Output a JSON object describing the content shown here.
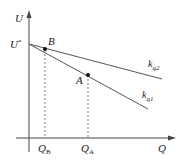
{
  "diagram": {
    "axes": {
      "y_label": "U",
      "x_label": "Q"
    },
    "origin_value": {
      "label": "U",
      "superscript": "*"
    },
    "lines": [
      {
        "name": "kq2",
        "label_main": "k",
        "label_sub": "q2",
        "role": "upper line (shallower slope)"
      },
      {
        "name": "kq1",
        "label_main": "k",
        "label_sub": "q1",
        "role": "lower line (steeper slope)"
      }
    ],
    "points": [
      {
        "name": "B",
        "label": "B",
        "line": "kq1"
      },
      {
        "name": "A",
        "label": "A",
        "line": "kq1"
      }
    ],
    "x_ticks": [
      {
        "label_main": "Q",
        "label_sub": "B"
      },
      {
        "label_main": "Q",
        "label_sub": "A"
      }
    ],
    "colors": {
      "line": "#555555",
      "axis": "#444444",
      "point": "#111111"
    }
  }
}
